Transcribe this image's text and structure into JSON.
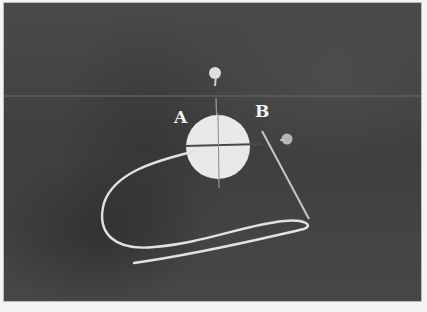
{
  "image": {
    "description": "Grayscale photograph of a refraction experiment: a white semicircular/circular disk with crosshair lines on dark fabric, two pins, a looped white string, and a straight rod",
    "labels": {
      "a": "A",
      "b": "B"
    },
    "colors": {
      "background": "#444444",
      "disk": "#e8e8e8",
      "string": "#e0e0e0",
      "border": "#bdbdbd"
    }
  }
}
